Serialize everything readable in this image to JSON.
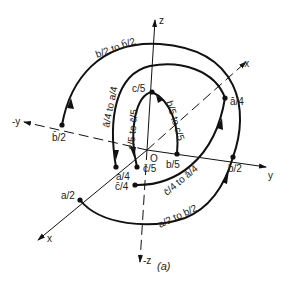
{
  "figure": {
    "caption": "(a)",
    "origin_label": "O",
    "axes": {
      "z": "z",
      "neg_z": "-z",
      "y": "y",
      "neg_y": "-y",
      "x": "x",
      "neg_x": "-x"
    },
    "points": {
      "bbar_2": "b̄/2",
      "a_2": "a/2",
      "a_4": "a/4",
      "c_5": "c/5",
      "b_5": "b/5",
      "abar_4": "ā/4",
      "b_2": "b/2",
      "cbar_5": "c̄/5",
      "cbar_4": "c̄/4"
    },
    "paths": {
      "b2_to_bbar2": "b/2 to b̄/2",
      "abar4_to_a4": "ā/4 to a/4",
      "c5_to_cbar5": "c/5 to c̄/5",
      "b5_to_c5": "b/5 to c/5",
      "cbar4_to_abar4": "c̄/4 to ā/4",
      "a2_to_b2": "a/2 to b/2"
    },
    "colors": {
      "ink": "#111111",
      "background": "#ffffff"
    }
  }
}
